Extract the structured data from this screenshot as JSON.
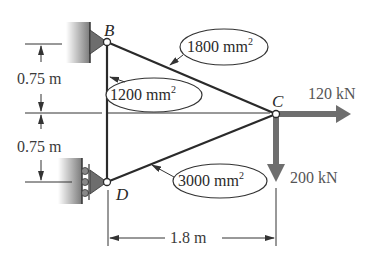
{
  "diagram": {
    "type": "truss",
    "nodes": {
      "B": {
        "label": "B",
        "support": "pin (fixed wall)"
      },
      "C": {
        "label": "C",
        "support": "free (loaded joint)"
      },
      "D": {
        "label": "D",
        "support": "roller (wall)"
      }
    },
    "members": [
      {
        "id": "BC",
        "area_value": "1800",
        "area_unit": "mm",
        "area_exp": "2"
      },
      {
        "id": "BD",
        "area_value": "1200",
        "area_unit": "mm",
        "area_exp": "2"
      },
      {
        "id": "CD",
        "area_value": "3000",
        "area_unit": "mm",
        "area_exp": "2"
      }
    ],
    "loads": [
      {
        "at": "C",
        "direction": "right",
        "label": "120 kN"
      },
      {
        "at": "C",
        "direction": "down",
        "label": "200 kN"
      }
    ],
    "dimensions": {
      "upper_vertical": "0.75 m",
      "lower_vertical": "0.75 m",
      "horizontal": "1.8 m"
    },
    "colors": {
      "line": "#2a2a2a",
      "load_arrow": "#6e6e6e",
      "wall_hatch": "#8a8a8a",
      "support": "#777777"
    }
  }
}
